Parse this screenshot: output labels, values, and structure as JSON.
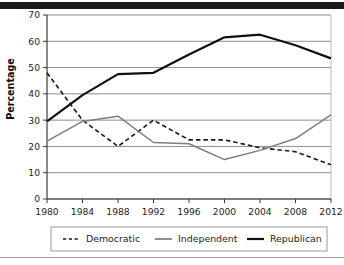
{
  "figure": {
    "name": "party-identification-line-chart",
    "top_bar_color": "#1b1b1b",
    "bottom_rule_color": "#9a9a9a",
    "background": "#ffffff"
  },
  "chart_data": {
    "type": "line",
    "title": "",
    "subtitle": "",
    "xlabel": "",
    "ylabel": "Percentage",
    "x": [
      1980,
      1984,
      1988,
      1992,
      1996,
      2000,
      2004,
      2008,
      2012
    ],
    "categories": [
      "1980",
      "1984",
      "1988",
      "1992",
      "1996",
      "2000",
      "2004",
      "2008",
      "2012"
    ],
    "xtick_labels": [
      "1980",
      "1984",
      "1988",
      "1992",
      "1996",
      "2000",
      "2004",
      "2008",
      "2012"
    ],
    "ytick_labels": [
      "0",
      "10",
      "20",
      "30",
      "40",
      "50",
      "60",
      "70"
    ],
    "yticks": [
      0,
      10,
      20,
      30,
      40,
      50,
      60,
      70
    ],
    "ylim": [
      0,
      70
    ],
    "xlim": [
      1980,
      2012
    ],
    "grid": "horizontal",
    "legend_position": "bottom",
    "series": [
      {
        "name": "Democratic",
        "style": "dashed",
        "color": "#1a1a1a",
        "width": 1.6,
        "values": [
          48,
          30,
          20,
          30,
          22.5,
          22.5,
          19.5,
          18,
          13
        ]
      },
      {
        "name": "Independent",
        "style": "solid",
        "color": "#7d7d7d",
        "width": 1.5,
        "values": [
          22,
          29.5,
          31.5,
          21.5,
          21,
          15,
          18.5,
          23,
          32
        ]
      },
      {
        "name": "Republican",
        "style": "solid",
        "color": "#111111",
        "width": 2.2,
        "values": [
          29.5,
          39.5,
          47.5,
          48,
          55,
          61.5,
          62.5,
          58.5,
          53.5
        ]
      }
    ]
  },
  "legend": {
    "items": [
      {
        "label": "Democratic",
        "style": "dashed",
        "color": "#1a1a1a"
      },
      {
        "label": "Independent",
        "style": "solid",
        "color": "#7d7d7d"
      },
      {
        "label": "Republican",
        "style": "solid",
        "color": "#111111"
      }
    ]
  },
  "axes": {
    "y_axis_title": "Percentage",
    "gridline_color": "#888888",
    "axis_color": "#3a3a3a"
  }
}
